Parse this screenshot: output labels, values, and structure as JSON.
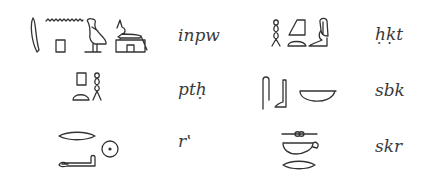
{
  "figure": {
    "entries": [
      {
        "id": "anubis",
        "transliteration": "inpw",
        "glyphs": [
          "reed-leaf",
          "water-ripple",
          "stool-square",
          "quail-chick",
          "jackal-on-shrine"
        ]
      },
      {
        "id": "heqet",
        "transliteration": "ḥḳt",
        "glyphs": [
          "twisted-flax",
          "hill-slope",
          "bread-loaf",
          "seated-goddess"
        ]
      },
      {
        "id": "ptah",
        "transliteration": "ptḥ",
        "glyphs": [
          "stool-square",
          "bread-loaf",
          "twisted-flax"
        ]
      },
      {
        "id": "sobek",
        "transliteration": "sbk",
        "glyphs": [
          "folded-cloth",
          "leg-foot",
          "basket"
        ]
      },
      {
        "id": "ra",
        "transliteration": "r‛",
        "glyphs": [
          "mouth",
          "forearm",
          "sun-disk"
        ]
      },
      {
        "id": "sokar",
        "transliteration": "skr",
        "glyphs": [
          "door-bolt",
          "basket-handle",
          "mouth"
        ]
      }
    ]
  }
}
